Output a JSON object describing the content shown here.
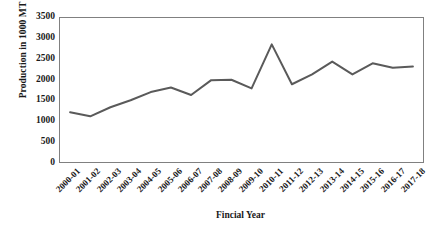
{
  "chart_data": {
    "type": "line",
    "title": "",
    "xlabel": "Fincial Year",
    "ylabel": "Production in 1000 MT",
    "categories": [
      "2000-01",
      "2001-02",
      "2002-03",
      "2003-04",
      "2004-05",
      "2005-06",
      "2006-07",
      "2007-08",
      "2008-09",
      "2009-10",
      "2010-11",
      "2011-12",
      "2012-13",
      "2013-14",
      "2014-15",
      "2015-16",
      "2016-17",
      "2017-18"
    ],
    "values": [
      1210,
      1110,
      1330,
      1500,
      1700,
      1810,
      1630,
      1990,
      2000,
      1790,
      2860,
      1890,
      2130,
      2440,
      2130,
      2400,
      2290,
      2320
    ],
    "series": [
      {
        "name": "Production",
        "values": [
          1210,
          1110,
          1330,
          1500,
          1700,
          1810,
          1630,
          1990,
          2000,
          1790,
          2860,
          1890,
          2130,
          2440,
          2130,
          2400,
          2290,
          2320
        ],
        "color": "#5a5a5a"
      }
    ],
    "ylim": [
      0,
      3500
    ],
    "y_ticks": [
      0,
      500,
      1000,
      1500,
      2000,
      2500,
      3000,
      3500
    ],
    "y_tick_labels": [
      "0",
      "500",
      "1000",
      "1500",
      "2000",
      "2500",
      "3000",
      "3500"
    ],
    "grid": false,
    "legend": false,
    "legend_position": "none",
    "line_color": "#5a5a5a",
    "line_width": 2,
    "plot_border_color": "#808080",
    "background_color": "#ffffff",
    "markers": false
  }
}
